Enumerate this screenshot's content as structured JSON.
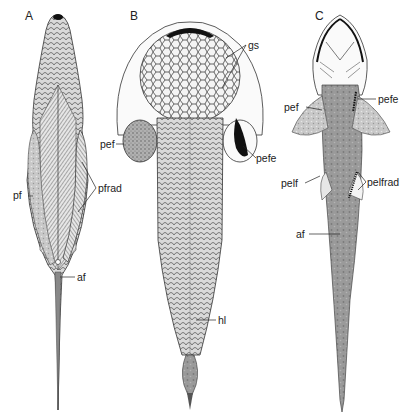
{
  "figure": {
    "panels": [
      {
        "id": "A",
        "label": "A"
      },
      {
        "id": "B",
        "label": "B"
      },
      {
        "id": "C",
        "label": "C"
      }
    ],
    "labels": {
      "A": {
        "pf": "pf",
        "pfrad": "pfrad",
        "af": "af"
      },
      "B": {
        "gs": "gs",
        "pef": "pef",
        "pefe": "pefe",
        "hl": "hl"
      },
      "C": {
        "pef": "pef",
        "pefe": "pefe",
        "pelf": "pelf",
        "pelfrad": "pelfrad",
        "af": "af"
      }
    },
    "colors": {
      "ink": "#222222",
      "shade_dark": "#555555",
      "shade_mid": "#8a8a8a",
      "shade_light": "#bdbdbd",
      "background": "#ffffff"
    }
  }
}
